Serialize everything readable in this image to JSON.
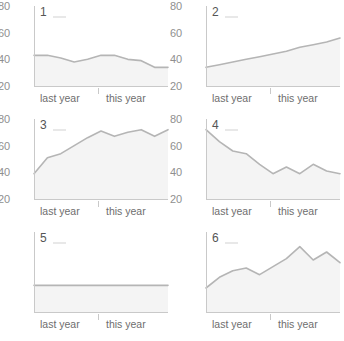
{
  "chart_data": {
    "type": "line",
    "title": "",
    "subtitle": "",
    "xlabel": "",
    "ylabel": "",
    "layout": {
      "rows": 3,
      "cols": 2,
      "small_multiples": true,
      "grid": false,
      "legend_position": "panel-inline"
    },
    "ylim": [
      20,
      80
    ],
    "y_ticks": [
      "80",
      "60",
      "40",
      "20"
    ],
    "x_tick_labels": [
      "last year",
      "this year"
    ],
    "x_divider_label": "year boundary",
    "colors": {
      "line": "#b5b5b5",
      "fill": "#f2f2f2",
      "axis": "#c9c9c9",
      "tick_text": "#8f8f8f",
      "panel_number": "#555555"
    },
    "panels": [
      {
        "id": "1",
        "label": "1",
        "description": "wavy slow decline",
        "x": [
          0,
          1,
          2,
          3,
          4,
          5,
          6,
          7,
          8,
          9,
          10
        ],
        "values": [
          43,
          43,
          41,
          38,
          40,
          43,
          43,
          40,
          39,
          34,
          34
        ]
      },
      {
        "id": "2",
        "label": "2",
        "description": "steady linear rise",
        "x": [
          0,
          1,
          2,
          3,
          4,
          5,
          6,
          7,
          8,
          9,
          10
        ],
        "values": [
          34,
          36,
          38,
          40,
          42,
          44,
          46,
          49,
          51,
          53,
          56
        ]
      },
      {
        "id": "3",
        "label": "3",
        "description": "steep rise then plateau with oscillation",
        "x": [
          0,
          1,
          2,
          3,
          4,
          5,
          6,
          7,
          8,
          9,
          10
        ],
        "values": [
          39,
          51,
          54,
          60,
          66,
          71,
          67,
          70,
          72,
          67,
          72
        ]
      },
      {
        "id": "4",
        "label": "4",
        "description": "steep decline then oscillation",
        "x": [
          0,
          1,
          2,
          3,
          4,
          5,
          6,
          7,
          8,
          9,
          10
        ],
        "values": [
          72,
          63,
          56,
          54,
          46,
          39,
          44,
          39,
          46,
          41,
          39
        ]
      },
      {
        "id": "5",
        "label": "5",
        "description": "perfectly flat constant",
        "x": [
          0,
          1,
          2,
          3,
          4,
          5,
          6,
          7,
          8,
          9,
          10
        ],
        "values": [
          40,
          40,
          40,
          40,
          40,
          40,
          40,
          40,
          40,
          40,
          40
        ]
      },
      {
        "id": "6",
        "label": "6",
        "description": "rise with oscillation, peak then fall",
        "x": [
          0,
          1,
          2,
          3,
          4,
          5,
          6,
          7,
          8,
          9,
          10
        ],
        "values": [
          38,
          46,
          51,
          53,
          48,
          54,
          60,
          69,
          59,
          65,
          57
        ]
      }
    ]
  }
}
